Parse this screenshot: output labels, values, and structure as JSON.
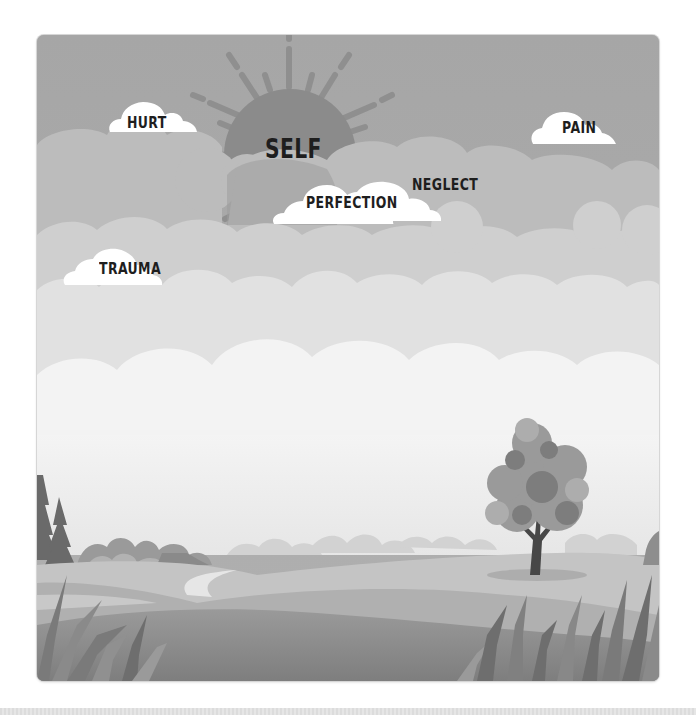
{
  "illustration": {
    "sun_label": "SELF",
    "clouds": [
      {
        "id": "hurt",
        "label": "HURT"
      },
      {
        "id": "pain",
        "label": "PAIN"
      },
      {
        "id": "perfection",
        "label": "PERFECTION"
      },
      {
        "id": "neglect",
        "label": "NEGLECT"
      },
      {
        "id": "trauma",
        "label": "TRAUMA"
      }
    ],
    "colors": {
      "sky": "#a9a9a9",
      "sun": "#8c8c8c",
      "sun_rays": "#8f8f8f",
      "label_cloud": "#ffffff",
      "label_text": "#1e1e1e",
      "far_clouds": "#bdbdbd",
      "mid_clouds": "#d4d4d4",
      "near_clouds": "#f2f2f2",
      "hill": "#b8b8b8",
      "foreground": "#8a8a8a",
      "tree_foliage": "#8e8e8e",
      "tree_trunk": "#4a4a4a"
    }
  }
}
